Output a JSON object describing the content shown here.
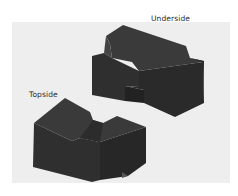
{
  "figure": {
    "labels": {
      "underside": "Underside",
      "topside": "Topside"
    },
    "colors": {
      "background": "#ffffff",
      "panel": "#eeeeee",
      "block_top": "#3a3a3a",
      "block_front": "#2f2f2f",
      "block_side": "#262626"
    },
    "objects": [
      {
        "name": "underside-block",
        "description": "dark rectangular block with notch, viewed from underside"
      },
      {
        "name": "topside-block",
        "description": "dark rectangular block with notch, viewed from topside"
      }
    ]
  }
}
